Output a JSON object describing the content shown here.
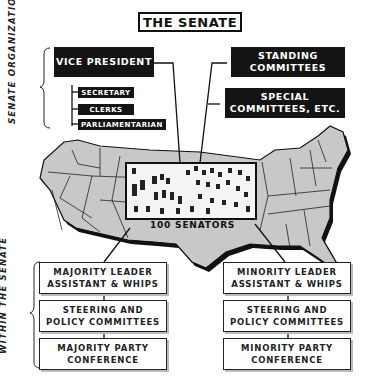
{
  "title": "THE SENATE",
  "side_labels": {
    "top": "SENATE ORGANIZATION",
    "bottom": "WITHIN THE SENATE"
  },
  "organization": {
    "vice_president": "VICE PRESIDENT",
    "vp_offices": [
      "SECRETARY",
      "CLERKS",
      "PARLIAMENTARIAN"
    ],
    "committees": [
      {
        "line1": "STANDING",
        "line2": "COMMITTEES"
      },
      {
        "line1": "SPECIAL",
        "line2": "COMMITTEES, ETC."
      }
    ]
  },
  "map": {
    "caption": "100 SENATORS",
    "fill_color": "#c8c8c8",
    "outline_color": "#111111"
  },
  "majority": [
    {
      "line1": "MAJORITY LEADER",
      "line2": "ASSISTANT & WHIPS"
    },
    {
      "line1": "STEERING AND",
      "line2": "POLICY COMMITTEES"
    },
    {
      "line1": "MAJORITY PARTY",
      "line2": "CONFERENCE"
    }
  ],
  "minority": [
    {
      "line1": "MINORITY LEADER",
      "line2": "ASSISTANT & WHIPS"
    },
    {
      "line1": "STEERING AND",
      "line2": "POLICY COMMITTEES"
    },
    {
      "line1": "MINORITY PARTY",
      "line2": "CONFERENCE"
    }
  ]
}
